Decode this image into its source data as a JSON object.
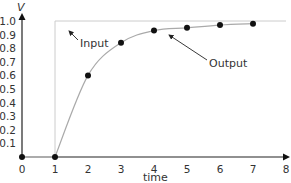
{
  "chart_data": {
    "type": "line",
    "title": "",
    "xlabel": "time",
    "ylabel": "V",
    "xlim": [
      0,
      8
    ],
    "ylim": [
      0,
      1.0
    ],
    "x_ticks": [
      "0",
      "1",
      "2",
      "3",
      "4",
      "5",
      "6",
      "7",
      "8"
    ],
    "y_ticks": [
      "0.1",
      "0.2",
      "0.3",
      "0.4",
      "0.5",
      "0.6",
      "0.7",
      "0.8",
      "0.9",
      "1.0"
    ],
    "grid": false,
    "series": [
      {
        "name": "Input",
        "style": "step, thin light gray",
        "x": [
          0,
          1,
          1,
          8
        ],
        "y": [
          0,
          0,
          1.0,
          1.0
        ]
      },
      {
        "name": "Output",
        "style": "smooth curve with black dot markers",
        "x": [
          0,
          1,
          2,
          3,
          4,
          5,
          6,
          7
        ],
        "y": [
          0,
          0,
          0.6,
          0.84,
          0.93,
          0.95,
          0.97,
          0.98
        ]
      }
    ],
    "annotations": [
      {
        "text": "Input",
        "arrow_to": [
          0.5,
          0.95
        ]
      },
      {
        "text": "Output",
        "arrow_to": [
          4.5,
          0.9
        ]
      }
    ],
    "colors": {
      "axis": "#222222",
      "input": "#cccccc",
      "output": "#aaaaaa",
      "marker": "#111111"
    }
  }
}
